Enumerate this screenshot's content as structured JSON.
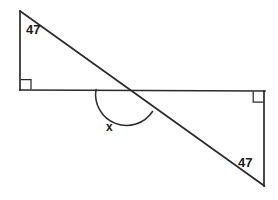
{
  "figure": {
    "kind": "geometry-diagram",
    "background_color": "#ffffff",
    "stroke_color": "#2b2b2b",
    "label_color": "#1a1a1a",
    "stroke_width": 1.6,
    "labels": {
      "top_left_angle": "47",
      "bottom_right_angle": "47",
      "unknown_angle": "x"
    },
    "geometry": {
      "left_triangle": {
        "apex": [
          20,
          11
        ],
        "right_angle_vertex": [
          20,
          90
        ],
        "base_end": [
          127,
          90
        ]
      },
      "right_triangle": {
        "right_angle_vertex": [
          264,
          91
        ],
        "bottom_vertex": [
          264,
          186
        ],
        "base_start": [
          127,
          90
        ]
      },
      "horizontal_line": {
        "from": [
          20,
          90
        ],
        "to": [
          265,
          91
        ]
      },
      "left_vertical_line": {
        "from": [
          20,
          11
        ],
        "to": [
          20,
          90
        ]
      },
      "right_vertical_line": {
        "from": [
          264,
          91
        ],
        "to": [
          264,
          186
        ]
      },
      "transversal": {
        "from": [
          20,
          11
        ],
        "to": [
          264,
          186
        ]
      },
      "intersection_point": [
        127,
        90
      ],
      "angle_arc": {
        "start": [
          96,
          90
        ],
        "end": [
          152,
          111
        ],
        "radius": 31
      },
      "right_angle_marker_left": {
        "x": 21,
        "y": 80,
        "size": 10
      },
      "right_angle_marker_right": {
        "x": 253,
        "y": 92,
        "size": 10
      }
    }
  }
}
